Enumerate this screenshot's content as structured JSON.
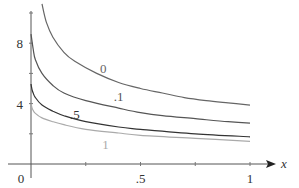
{
  "chart_data": {
    "type": "line",
    "title": "",
    "xlabel": "x",
    "ylabel": "",
    "xlim": [
      0,
      1
    ],
    "ylim": [
      0,
      10
    ],
    "grid": false,
    "x_ticks": [
      0.25,
      0.5,
      0.75,
      1
    ],
    "x_tick_labels": [
      {
        "value": 0,
        "label": "0"
      },
      {
        "value": 0.5,
        "label": ".5"
      },
      {
        "value": 1,
        "label": "1"
      }
    ],
    "y_ticks": [
      2,
      4,
      6,
      8,
      10
    ],
    "y_tick_labels": [
      {
        "value": 4,
        "label": "4"
      },
      {
        "value": 8,
        "label": "8"
      }
    ],
    "series": [
      {
        "name": "0",
        "color": "#666666",
        "label_at": [
          0.33,
          6.0
        ],
        "x": [
          0.05,
          0.07,
          0.1,
          0.15,
          0.2,
          0.3,
          0.4,
          0.5,
          0.6,
          0.7,
          0.8,
          0.9,
          1.0
        ],
        "y": [
          10.6,
          9.4,
          8.4,
          7.4,
          6.8,
          6.0,
          5.4,
          5.0,
          4.7,
          4.4,
          4.2,
          4.05,
          3.9
        ]
      },
      {
        "name": ".1",
        "color": "#555555",
        "label_at": [
          0.4,
          4.2
        ],
        "x": [
          0.0,
          0.01,
          0.02,
          0.05,
          0.1,
          0.15,
          0.25,
          0.4,
          0.5,
          0.6,
          0.75,
          0.9,
          1.0
        ],
        "y": [
          8.6,
          7.6,
          6.9,
          6.0,
          5.2,
          4.7,
          4.2,
          3.7,
          3.4,
          3.2,
          3.0,
          2.8,
          2.7
        ]
      },
      {
        "name": ".5",
        "color": "#333333",
        "label_at": [
          0.2,
          3.0
        ],
        "x": [
          0.0,
          0.005,
          0.01,
          0.02,
          0.05,
          0.1,
          0.15,
          0.25,
          0.4,
          0.5,
          0.75,
          1.0
        ],
        "y": [
          5.3,
          4.9,
          4.7,
          4.4,
          3.9,
          3.5,
          3.2,
          2.8,
          2.45,
          2.3,
          2.0,
          1.8
        ]
      },
      {
        "name": "1",
        "color": "#aaaaaa",
        "label_at": [
          0.34,
          1.0
        ],
        "x": [
          0.0,
          0.005,
          0.01,
          0.02,
          0.05,
          0.1,
          0.15,
          0.25,
          0.4,
          0.5,
          0.75,
          1.0
        ],
        "y": [
          4.0,
          3.7,
          3.55,
          3.35,
          3.05,
          2.8,
          2.6,
          2.3,
          2.05,
          1.9,
          1.7,
          1.5
        ]
      }
    ]
  }
}
